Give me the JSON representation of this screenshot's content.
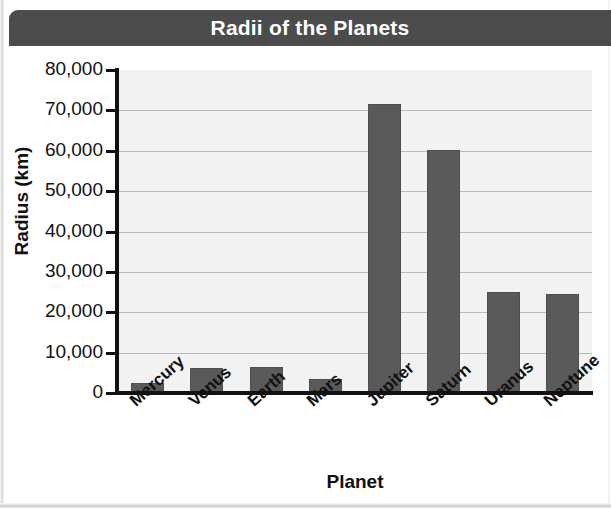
{
  "title": "Radii of the Planets",
  "axis": {
    "x_title": "Planet",
    "y_title": "Radius (km)",
    "y_ticks": [
      "80,000",
      "70,000",
      "60,000",
      "50,000",
      "40,000",
      "30,000",
      "20,000",
      "10,000",
      "0"
    ]
  },
  "colors": {
    "title_bar": "#4c4c4c",
    "title_text": "#ffffff",
    "bar_fill": "#5a5a5a",
    "plot_background": "#f2f2f2",
    "gridline": "#b9b9b9",
    "axis": "#111111"
  },
  "chart_data": {
    "type": "bar",
    "title": "Radii of the Planets",
    "xlabel": "Planet",
    "ylabel": "Radius (km)",
    "ylim": [
      0,
      80000
    ],
    "ytick_step": 10000,
    "grid": true,
    "legend": null,
    "categories": [
      "Mercury",
      "Venus",
      "Earth",
      "Mars",
      "Jupiter",
      "Saturn",
      "Uranus",
      "Neptune"
    ],
    "values": [
      2400,
      6100,
      6400,
      3400,
      71500,
      60300,
      25000,
      24600
    ]
  }
}
